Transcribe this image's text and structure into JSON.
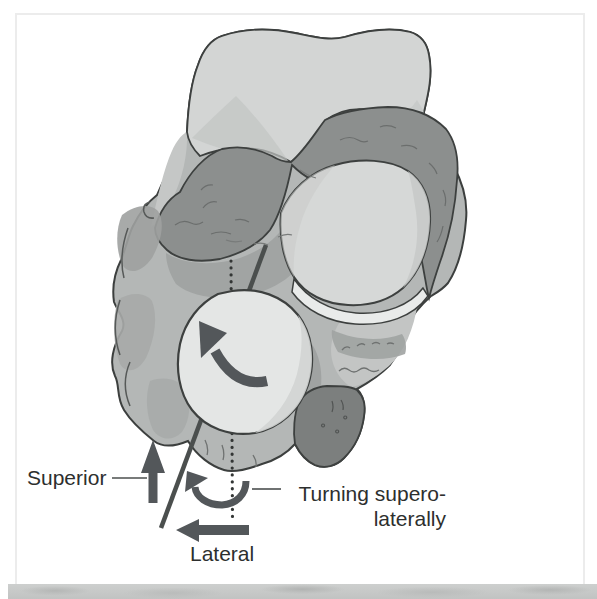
{
  "figure": {
    "labels": {
      "superior": "Superior",
      "lateral": "Lateral",
      "turning_line1": "Turning supero-",
      "turning_line2": "laterally"
    },
    "palette": {
      "annotation_gray": "#53575a",
      "leader_gray": "#4b4f4e",
      "text_color": "#2d2f2e",
      "bone_light": "#d3d5d4",
      "bone_mid": "#b4b7b6",
      "bone_dark": "#8c8f8e",
      "outline": "#3c3f3e"
    }
  }
}
